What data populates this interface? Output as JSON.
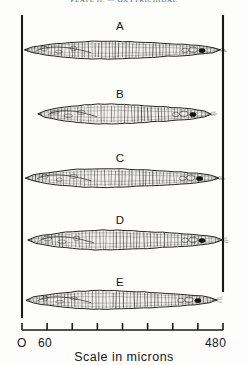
{
  "figure": {
    "header_text": "PLATE  II.  —  OXYTRICHIDAE",
    "caption": "Scale  in  microns",
    "background_color": "#fdfdfc",
    "ink_color": "#1a1a1a"
  },
  "axis": {
    "label_zero": "O",
    "label_sixty": "60",
    "label_max": "480",
    "unit": "microns",
    "tick_values": [
      0,
      60,
      120,
      180,
      240,
      300,
      360,
      420,
      480
    ],
    "tick_count": 9,
    "axis_start_px": 22,
    "axis_end_px": 223,
    "axis_y_px": 330
  },
  "specimens": [
    {
      "id": "A",
      "label": "A",
      "label_x": 120,
      "label_y": 20,
      "body_y": 50,
      "left_micron": 6,
      "right_micron": 474,
      "height_px": 17,
      "stripe_count": 58,
      "nucleus_micron": 430,
      "taper": "both-ends-pointed"
    },
    {
      "id": "B",
      "label": "B",
      "label_x": 120,
      "label_y": 88,
      "body_y": 114,
      "left_micron": 38,
      "right_micron": 452,
      "height_px": 19,
      "stripe_count": 52,
      "nucleus_micron": 408,
      "taper": "rounded-left-pointed-right"
    },
    {
      "id": "C",
      "label": "C",
      "label_x": 120,
      "label_y": 152,
      "body_y": 178,
      "left_micron": 8,
      "right_micron": 470,
      "height_px": 18,
      "stripe_count": 56,
      "nucleus_micron": 424,
      "taper": "both-ends-pointed"
    },
    {
      "id": "D",
      "label": "D",
      "label_x": 120,
      "label_y": 214,
      "body_y": 240,
      "left_micron": 14,
      "right_micron": 478,
      "height_px": 19,
      "stripe_count": 57,
      "nucleus_micron": 430,
      "taper": "both-ends-pointed"
    },
    {
      "id": "E",
      "label": "E",
      "label_x": 120,
      "label_y": 276,
      "body_y": 300,
      "left_micron": 10,
      "right_micron": 466,
      "height_px": 18,
      "stripe_count": 55,
      "nucleus_micron": 420,
      "taper": "both-ends-pointed"
    }
  ],
  "frame": {
    "left_rule_x": 22,
    "left_rule_top": 15,
    "left_rule_bottom": 318,
    "right_rule_x": 223,
    "right_rule_top": 15,
    "right_rule_bottom": 292
  }
}
